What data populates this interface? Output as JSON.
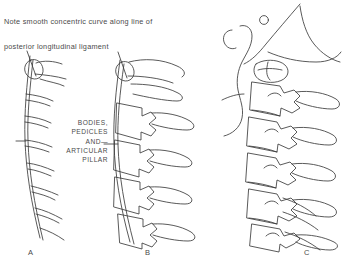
{
  "figure": {
    "background_color": "#ffffff",
    "ink_color": "#3c3c3c",
    "text_color": "#4a4a4a",
    "width": 344,
    "height": 266
  },
  "caption": {
    "line1": "Note smooth concentric curve along line of",
    "line2": "posterior longitudinal ligament"
  },
  "callout": {
    "line1": "BODIES,",
    "line2": "PEDICLES",
    "line3": "AND—",
    "line4": "ARTICULAR",
    "line5": "PILLAR"
  },
  "panels": [
    {
      "letter": "A",
      "name": "schematic-curve",
      "description": "Simple line schematic of cervical spine showing the smooth lordotic curve with short transverse segment marks"
    },
    {
      "letter": "B",
      "name": "bodies-pedicles-pillars",
      "description": "Cervical vertebrae outlined as bodies, pedicles and articular pillars stacked along the curve"
    },
    {
      "letter": "C",
      "name": "detailed-anatomy",
      "description": "Fully detailed lateral cervical spine with skull base, occiput, atlas, axis and long spinous processes"
    }
  ]
}
